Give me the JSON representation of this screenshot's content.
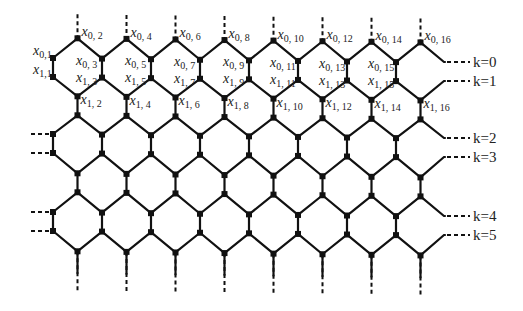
{
  "figure": {
    "colors": {
      "line": "#111111",
      "background": "#ffffff",
      "text": "#222222"
    }
  },
  "grid": {
    "x0": 53,
    "dx": 24.5,
    "columns": 16,
    "row_y": [
      38,
      58,
      77,
      96,
      115,
      134,
      153,
      173,
      192,
      212,
      231,
      251
    ],
    "top_stub_y": 14,
    "bottom_stub_y": 292,
    "tilt_per_px": 0.012
  },
  "vertex_labels": [
    {
      "name": "x",
      "sub": "0, 2",
      "col": 1,
      "row": 0,
      "dx": 4,
      "dy": -2
    },
    {
      "name": "x",
      "sub": "0, 4",
      "col": 3,
      "row": 0,
      "dx": 4,
      "dy": -2
    },
    {
      "name": "x",
      "sub": "0, 6",
      "col": 5,
      "row": 0,
      "dx": 4,
      "dy": -2
    },
    {
      "name": "x",
      "sub": "0, 8",
      "col": 7,
      "row": 0,
      "dx": 4,
      "dy": -2
    },
    {
      "name": "x",
      "sub": "0, 10",
      "col": 9,
      "row": 0,
      "dx": 4,
      "dy": -2
    },
    {
      "name": "x",
      "sub": "0, 12",
      "col": 11,
      "row": 0,
      "dx": 4,
      "dy": -2
    },
    {
      "name": "x",
      "sub": "0, 14",
      "col": 13,
      "row": 0,
      "dx": 4,
      "dy": -2
    },
    {
      "name": "x",
      "sub": "0, 16",
      "col": 15,
      "row": 0,
      "dx": 4,
      "dy": -2
    },
    {
      "name": "x",
      "sub": "0,1",
      "col": 0,
      "row": 1,
      "dx": -20,
      "dy": -3
    },
    {
      "name": "x",
      "sub": "1,1",
      "col": 0,
      "row": 2,
      "dx": -20,
      "dy": -3
    },
    {
      "name": "x",
      "sub": "0, 3",
      "col": 2,
      "row": 1,
      "dx": -26,
      "dy": 6
    },
    {
      "name": "x",
      "sub": "0, 5",
      "col": 4,
      "row": 1,
      "dx": -26,
      "dy": 6
    },
    {
      "name": "x",
      "sub": "0, 7",
      "col": 6,
      "row": 1,
      "dx": -26,
      "dy": 6
    },
    {
      "name": "x",
      "sub": "0, 9",
      "col": 8,
      "row": 1,
      "dx": -26,
      "dy": 6
    },
    {
      "name": "x",
      "sub": "0, 11",
      "col": 10,
      "row": 1,
      "dx": -28,
      "dy": 6
    },
    {
      "name": "x",
      "sub": "0, 13",
      "col": 12,
      "row": 1,
      "dx": -28,
      "dy": 6
    },
    {
      "name": "x",
      "sub": "0, 15",
      "col": 14,
      "row": 1,
      "dx": -28,
      "dy": 6
    },
    {
      "name": "x",
      "sub": "1, 3",
      "col": 2,
      "row": 2,
      "dx": -26,
      "dy": 4
    },
    {
      "name": "x",
      "sub": "1, 5",
      "col": 4,
      "row": 2,
      "dx": -26,
      "dy": 4
    },
    {
      "name": "x",
      "sub": "1, 7",
      "col": 6,
      "row": 2,
      "dx": -26,
      "dy": 4
    },
    {
      "name": "x",
      "sub": "1, 9",
      "col": 8,
      "row": 2,
      "dx": -26,
      "dy": 4
    },
    {
      "name": "x",
      "sub": "1, 11",
      "col": 10,
      "row": 2,
      "dx": -28,
      "dy": 4
    },
    {
      "name": "x",
      "sub": "1, 13",
      "col": 12,
      "row": 2,
      "dx": -28,
      "dy": 4
    },
    {
      "name": "x",
      "sub": "1, 15",
      "col": 14,
      "row": 2,
      "dx": -28,
      "dy": 4
    },
    {
      "name": "x",
      "sub": "1, 2",
      "col": 1,
      "row": 3,
      "dx": 3,
      "dy": 8
    },
    {
      "name": "x",
      "sub": "1, 4",
      "col": 3,
      "row": 3,
      "dx": 3,
      "dy": 8
    },
    {
      "name": "x",
      "sub": "1, 6",
      "col": 5,
      "row": 3,
      "dx": 3,
      "dy": 8
    },
    {
      "name": "x",
      "sub": "1, 8",
      "col": 7,
      "row": 3,
      "dx": 3,
      "dy": 8
    },
    {
      "name": "x",
      "sub": "1, 10",
      "col": 9,
      "row": 3,
      "dx": 3,
      "dy": 8
    },
    {
      "name": "x",
      "sub": "1, 12",
      "col": 11,
      "row": 3,
      "dx": 3,
      "dy": 8
    },
    {
      "name": "x",
      "sub": "1, 14",
      "col": 13,
      "row": 3,
      "dx": 3,
      "dy": 8
    },
    {
      "name": "x",
      "sub": "1, 16",
      "col": 15,
      "row": 3,
      "dx": 3,
      "dy": 8
    }
  ],
  "layer_labels": [
    {
      "text": "k=0",
      "y": 62
    },
    {
      "text": "k=1",
      "y": 81
    },
    {
      "text": "k=2",
      "y": 138
    },
    {
      "text": "k=3",
      "y": 157
    },
    {
      "text": "k=4",
      "y": 216
    },
    {
      "text": "k=5",
      "y": 235
    }
  ],
  "layer_label_x": 473,
  "layer_dash": {
    "x1": 447,
    "x2": 470
  }
}
